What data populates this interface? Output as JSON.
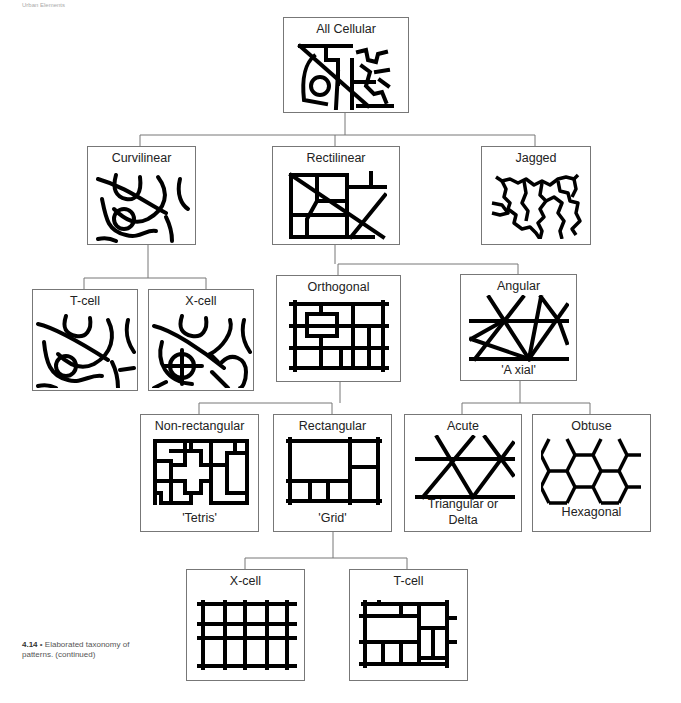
{
  "header": {
    "running_head": "Urban Elements"
  },
  "nodes": {
    "all_cellular": {
      "title": "All Cellular"
    },
    "curvilinear": {
      "title": "Curvilinear"
    },
    "rectilinear": {
      "title": "Rectilinear"
    },
    "jagged": {
      "title": "Jagged"
    },
    "t_cell_curv": {
      "title": "T-cell"
    },
    "x_cell_curv": {
      "title": "X-cell"
    },
    "orthogonal": {
      "title": "Orthogonal"
    },
    "angular": {
      "title": "Angular",
      "subtitle": "'A xial'"
    },
    "non_rectangular": {
      "title": "Non-rectangular",
      "subtitle": "'Tetris'"
    },
    "rectangular": {
      "title": "Rectangular",
      "subtitle": "'Grid'"
    },
    "acute": {
      "title": "Acute",
      "subtitle_1": "Triangular or",
      "subtitle_2": "Delta"
    },
    "obtuse": {
      "title": "Obtuse",
      "subtitle": "Hexagonal"
    },
    "x_cell_rect": {
      "title": "X-cell"
    },
    "t_cell_rect": {
      "title": "T-cell"
    }
  },
  "caption": {
    "number": "4.14",
    "bullet": "•",
    "text": "Elaborated taxonomy of patterns. (continued)"
  },
  "colors": {
    "line": "#777777",
    "pattern": "#000000",
    "background": "#ffffff"
  }
}
